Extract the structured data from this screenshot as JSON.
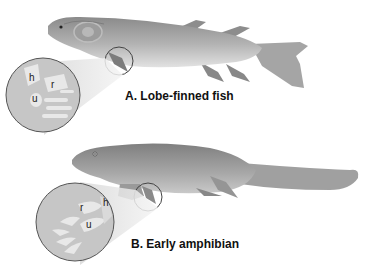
{
  "figure": {
    "panels": [
      {
        "id": "A",
        "caption": "A. Lobe-finned fish",
        "subject": "lobe-finned fish",
        "inset_labels": [
          "h",
          "r",
          "u"
        ]
      },
      {
        "id": "B",
        "caption": "B. Early amphibian",
        "subject": "early amphibian",
        "inset_labels": [
          "r",
          "h",
          "u"
        ]
      }
    ],
    "colors": {
      "background": "#ffffff",
      "body_gray": "#9a9a9a",
      "inset_fill": "#c8c8c8",
      "bone_fill": "#e6e6e6",
      "outline": "#555555"
    }
  }
}
